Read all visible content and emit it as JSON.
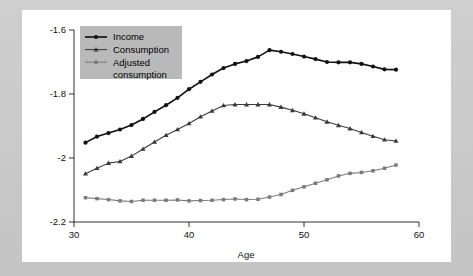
{
  "figure": {
    "background_color": "#c9c9c9",
    "card_color": "#ffffff"
  },
  "chart_data": {
    "type": "line",
    "title": "",
    "subtitle": "",
    "xlabel": "Age",
    "ylabel": "",
    "xlim": [
      30,
      60
    ],
    "ylim": [
      -2.2,
      -1.6
    ],
    "xticks": [
      30,
      40,
      50,
      60
    ],
    "xtick_labels": [
      "30",
      "40",
      "50",
      "60"
    ],
    "yticks": [
      -1.6,
      -1.8,
      -2.0,
      -2.2
    ],
    "ytick_labels": [
      "-1.6",
      "-1.8",
      "-2",
      "-2.2"
    ],
    "grid": false,
    "legend_position": "upper left",
    "x": [
      31,
      32,
      33,
      34,
      35,
      36,
      37,
      38,
      39,
      40,
      41,
      42,
      43,
      44,
      45,
      46,
      47,
      48,
      49,
      50,
      51,
      52,
      53,
      54,
      55,
      56,
      57,
      58
    ],
    "series": [
      {
        "name": "Income",
        "color": "#111111",
        "marker": "circle",
        "values": [
          -1.952,
          -1.933,
          -1.922,
          -1.911,
          -1.897,
          -1.878,
          -1.856,
          -1.835,
          -1.812,
          -1.785,
          -1.762,
          -1.739,
          -1.719,
          -1.706,
          -1.697,
          -1.684,
          -1.663,
          -1.668,
          -1.675,
          -1.683,
          -1.691,
          -1.7,
          -1.701,
          -1.701,
          -1.706,
          -1.714,
          -1.723,
          -1.724
        ]
      },
      {
        "name": "Consumption",
        "color": "#3a3a3a",
        "marker": "triangle",
        "values": [
          -2.049,
          -2.032,
          -2.016,
          -2.011,
          -1.994,
          -1.972,
          -1.95,
          -1.929,
          -1.911,
          -1.892,
          -1.871,
          -1.853,
          -1.836,
          -1.833,
          -1.833,
          -1.833,
          -1.833,
          -1.841,
          -1.851,
          -1.862,
          -1.874,
          -1.887,
          -1.898,
          -1.908,
          -1.92,
          -1.932,
          -1.943,
          -1.947
        ]
      },
      {
        "name": "Adjusted consumption",
        "color": "#7a7a7a",
        "marker": "square",
        "values": [
          -2.124,
          -2.127,
          -2.13,
          -2.134,
          -2.136,
          -2.132,
          -2.132,
          -2.132,
          -2.131,
          -2.134,
          -2.133,
          -2.132,
          -2.13,
          -2.128,
          -2.13,
          -2.129,
          -2.122,
          -2.114,
          -2.101,
          -2.09,
          -2.079,
          -2.068,
          -2.056,
          -2.048,
          -2.045,
          -2.04,
          -2.032,
          -2.022
        ]
      }
    ]
  },
  "legend": {
    "entries": [
      {
        "label": "Income"
      },
      {
        "label": "Consumption"
      },
      {
        "label": "Adjusted"
      },
      {
        "label": "consumption"
      }
    ]
  }
}
